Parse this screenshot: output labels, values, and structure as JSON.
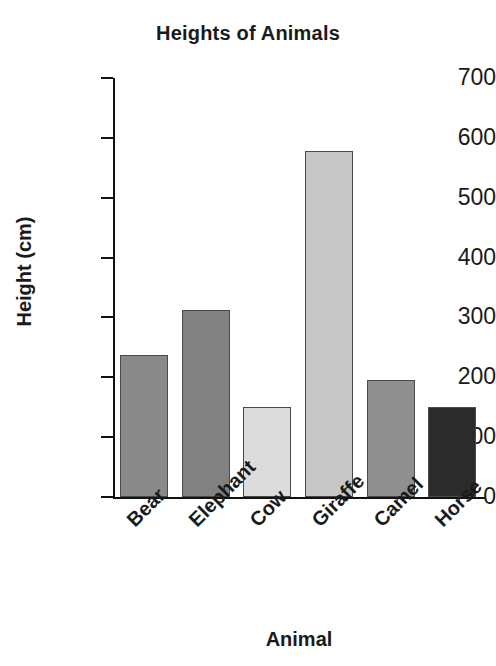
{
  "chart_data": {
    "type": "bar",
    "title": "Heights of Animals",
    "xlabel": "Animal",
    "ylabel": "Height (cm)",
    "categories": [
      "Bear",
      "Elephant",
      "Cow",
      "Giraffe",
      "Camel",
      "Horse"
    ],
    "values": [
      237,
      312,
      150,
      578,
      196,
      150
    ],
    "ylim": [
      0,
      700
    ],
    "ytick_labels": [
      "700",
      "600",
      "500",
      "400",
      "300",
      "200",
      "100",
      "0"
    ],
    "ytick_values": [
      700,
      600,
      500,
      400,
      300,
      200,
      100,
      0
    ],
    "grid": false,
    "legend": "none",
    "bar_colors": [
      "#8a8a8a",
      "#818181",
      "#dcdcdc",
      "#c7c7c7",
      "#8f8f8f",
      "#2b2b2b"
    ],
    "bar_edge_color": "#4a4a4a",
    "axis_color": "#111111",
    "background": "#ffffff",
    "xtick_rotation": 45
  }
}
